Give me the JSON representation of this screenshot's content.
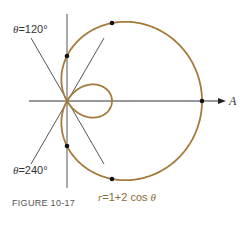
{
  "figure": {
    "caption": "FIGURE 10-17",
    "equation": {
      "r": "r",
      "eq": "=1+2 cos",
      "theta": "θ"
    },
    "labels": {
      "theta120": {
        "sym": "θ",
        "text": "=120°"
      },
      "theta240": {
        "sym": "θ",
        "text": "=240°"
      },
      "axis": "A"
    },
    "curve": {
      "type": "limacon",
      "formula": "r = 1 + 2 cos θ",
      "color": "#a47b3c"
    },
    "line_color": "#444444"
  }
}
